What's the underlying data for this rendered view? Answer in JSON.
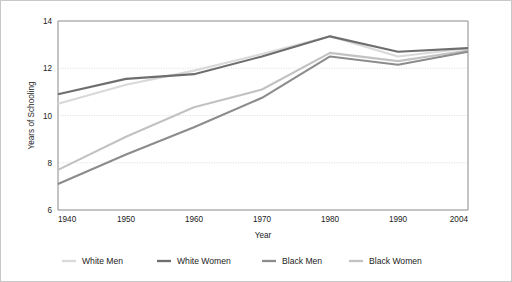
{
  "chart_data": {
    "type": "line",
    "title": "",
    "xlabel": "Year",
    "ylabel": "Years of Schooling",
    "x": [
      1940,
      1950,
      1960,
      1970,
      1980,
      1990,
      2004
    ],
    "xtick_labels": [
      "1940",
      "1950",
      "1960",
      "1970",
      "1980",
      "1990",
      "2004"
    ],
    "ytick_labels": [
      "6",
      "8",
      "10",
      "12",
      "14"
    ],
    "yticks": [
      6,
      8,
      10,
      12,
      14
    ],
    "xlim": [
      1940,
      2004
    ],
    "ylim": [
      6,
      14
    ],
    "grid": "horizontal-dotted",
    "legend_position": "bottom",
    "series": [
      {
        "name": "White Men",
        "color": "#d9d9d9",
        "values": [
          10.5,
          11.3,
          11.9,
          12.6,
          13.35,
          12.5,
          12.85
        ]
      },
      {
        "name": "White Women",
        "color": "#6e6e6e",
        "values": [
          10.9,
          11.55,
          11.75,
          12.5,
          13.35,
          12.7,
          12.85
        ]
      },
      {
        "name": "Black Men",
        "color": "#8c8c8c",
        "values": [
          7.1,
          8.35,
          9.5,
          10.75,
          12.5,
          12.15,
          12.7
        ]
      },
      {
        "name": "Black Women",
        "color": "#c2c2c2",
        "values": [
          7.7,
          9.1,
          10.35,
          11.1,
          12.65,
          12.3,
          12.75
        ]
      }
    ]
  },
  "axes": {
    "y_axis_title": "Years of Schooling",
    "x_axis_title": "Year"
  },
  "legend": {
    "items": [
      {
        "label": "White Men",
        "swatch": "#d9d9d9"
      },
      {
        "label": "White Women",
        "swatch": "#6e6e6e"
      },
      {
        "label": "Black Men",
        "swatch": "#8c8c8c"
      },
      {
        "label": "Black Women",
        "swatch": "#c2c2c2"
      }
    ]
  },
  "style": {
    "plot_border_color": "#8a8a8a",
    "grid_color": "#c9c9c9",
    "background": "#ffffff",
    "frame_color": "#c8c8c8"
  }
}
